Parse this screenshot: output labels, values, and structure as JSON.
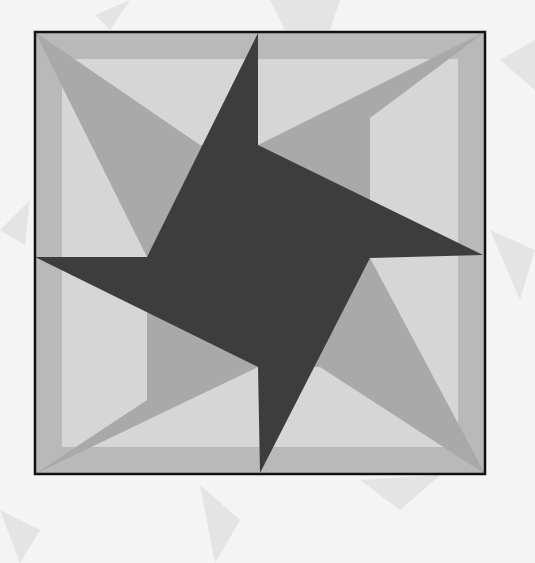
{
  "figure": {
    "title": "",
    "colors": {
      "background": "#f4f4f4",
      "ghost_shapes": "#e2e2e2",
      "frame_band": "#b9b9b9",
      "light_field": "#d6d6d6",
      "star_mid": "#a9a9a9",
      "pinwheel_dark": "#3d3d3d",
      "outline": "#111111"
    },
    "box": {
      "x1": 35,
      "y1": 32,
      "x2": 485,
      "y2": 474
    },
    "frame_band_width": 27,
    "pinwheel": [
      [
        258,
        33
      ],
      [
        258,
        145
      ],
      [
        483,
        255
      ],
      [
        370,
        258
      ],
      [
        260,
        473
      ],
      [
        258,
        367
      ],
      [
        35,
        257
      ],
      [
        147,
        257
      ]
    ],
    "star_kites": [
      [
        [
          35,
          32
        ],
        [
          200,
          145
        ],
        [
          258,
          145
        ],
        [
          147,
          257
        ]
      ],
      [
        [
          485,
          32
        ],
        [
          370,
          118
        ],
        [
          370,
          258
        ],
        [
          258,
          145
        ]
      ],
      [
        [
          485,
          474
        ],
        [
          320,
          367
        ],
        [
          258,
          367
        ],
        [
          370,
          258
        ]
      ],
      [
        [
          35,
          474
        ],
        [
          147,
          400
        ],
        [
          147,
          257
        ],
        [
          258,
          367
        ]
      ]
    ]
  }
}
